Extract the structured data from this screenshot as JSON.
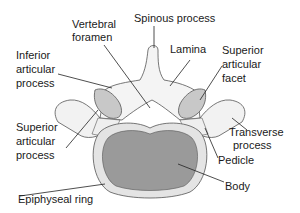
{
  "diagram": {
    "labels": {
      "vertebral_foramen": [
        "Vertebral",
        "foramen"
      ],
      "spinous_process": [
        "Spinous process"
      ],
      "inferior_articular_process": [
        "Inferior",
        "articular",
        "process"
      ],
      "lamina": [
        "Lamina"
      ],
      "superior_articular_facet": [
        "Superior",
        "articular",
        "facet"
      ],
      "superior_articular_process": [
        "Superior",
        "articular",
        "process"
      ],
      "transverse_process": [
        "Transverse",
        "process"
      ],
      "pedicle": [
        "Pedicle"
      ],
      "body": [
        "Body"
      ],
      "epiphyseal_ring": [
        "Epiphyseal ring"
      ]
    },
    "colors": {
      "bone": "#f2f2f2",
      "bone_outline": "#555555",
      "facet": "#c8c8c8",
      "ring": "#e4e4e4",
      "body_core": "#9a9a9a",
      "leader": "#222222"
    }
  }
}
